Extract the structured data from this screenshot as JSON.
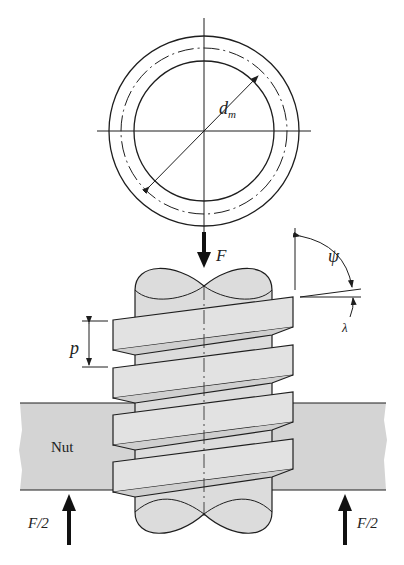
{
  "figure": {
    "labels": {
      "mean_diameter": "d",
      "mean_diameter_sub": "m",
      "axial_force": "F",
      "thread_angle_psi": "ψ",
      "lead_angle_lambda": "λ",
      "pitch": "p",
      "nut": "Nut",
      "reaction_left": "F/2",
      "reaction_right": "F/2"
    },
    "colors": {
      "line": "#1e1e1e",
      "screw_fill": "#dcdcdc",
      "thread_fill": "#e2e2e2",
      "nut_fill": "#d4d4d4",
      "background": "#ffffff"
    }
  }
}
